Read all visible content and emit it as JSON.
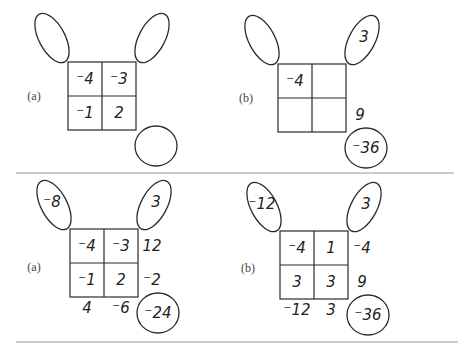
{
  "panels": [
    {
      "id": "top-a",
      "label": "(a)",
      "grid": [
        "⁻4",
        "⁻3",
        "⁻1",
        "2"
      ],
      "left_oval": "",
      "right_oval": "",
      "bottom_oval": "",
      "row_products": [
        "",
        ""
      ],
      "col_sums": [
        "",
        ""
      ]
    },
    {
      "id": "top-b",
      "label": "(b)",
      "grid": [
        "⁻4",
        "",
        "",
        ""
      ],
      "left_oval": "",
      "right_oval": "3",
      "bottom_oval": "⁻36",
      "row_products": [
        "",
        "9"
      ],
      "col_sums": [
        "",
        ""
      ]
    },
    {
      "id": "bottom-a",
      "label": "(a)",
      "grid": [
        "⁻4",
        "⁻3",
        "⁻1",
        "2"
      ],
      "left_oval": "⁻8",
      "right_oval": "3",
      "bottom_oval": "⁻24",
      "row_products": [
        "12",
        "⁻2"
      ],
      "col_sums": [
        "4",
        "⁻6"
      ]
    },
    {
      "id": "bottom-b",
      "label": "(b)",
      "grid": [
        "⁻4",
        "1",
        "3",
        "3"
      ],
      "left_oval": "⁻12",
      "right_oval": "3",
      "bottom_oval": "⁻36",
      "row_products": [
        "⁻4",
        "9"
      ],
      "col_sums": [
        "⁻12",
        "3"
      ]
    }
  ]
}
